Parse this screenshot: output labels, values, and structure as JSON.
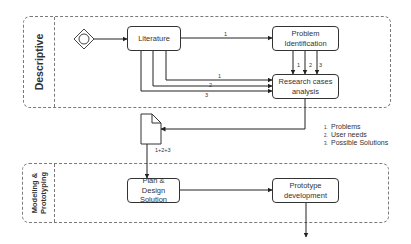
{
  "pools": [
    {
      "label": "Descriptive"
    },
    {
      "label": "Modeling & Prototyping",
      "label_lines": [
        "Modeling &",
        "Prototyping"
      ]
    }
  ],
  "tasks": {
    "literature": "Literature",
    "problem_identification": [
      "Problem",
      "Identification"
    ],
    "research_cases": [
      "Research cases",
      "analysis"
    ],
    "plan_design": [
      "Plan &",
      "Design Solution"
    ],
    "prototype": [
      "Prototype",
      "development"
    ]
  },
  "edge_labels": {
    "lit_to_problem": "1",
    "lit_to_research_1": "1",
    "lit_to_research_2": "2",
    "lit_to_research_3": "3",
    "problem_to_research_1": "1",
    "problem_to_research_2": "2",
    "problem_to_research_3": "3",
    "document_output": "1+2+3"
  },
  "legend": [
    {
      "num": "1.",
      "text": "Problems"
    },
    {
      "num": "2.",
      "text": "User needs"
    },
    {
      "num": "3.",
      "text": "Possible Solutions"
    }
  ],
  "elements": {
    "start_gateway": "event-based gateway",
    "document": "data object"
  }
}
